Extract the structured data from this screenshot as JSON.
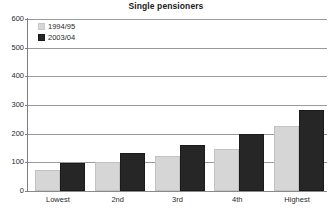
{
  "chart_data": {
    "type": "bar",
    "title": "Single pensioners",
    "xlabel": "",
    "ylabel": "",
    "ylim": [
      0,
      600
    ],
    "yticks": [
      0,
      100,
      200,
      300,
      400,
      500,
      600
    ],
    "grid": true,
    "legend_position": "top-left",
    "categories": [
      "Lowest",
      "2nd",
      "3rd",
      "4th",
      "Highest"
    ],
    "series": [
      {
        "name": "1994/95",
        "color": "#d6d6d6",
        "values": [
          75,
          102,
          123,
          148,
          226
        ]
      },
      {
        "name": "2003/04",
        "color": "#262626",
        "values": [
          98,
          131,
          161,
          198,
          283
        ]
      }
    ]
  },
  "legend": {
    "items": [
      {
        "label": "1994/95"
      },
      {
        "label": "2003/04"
      }
    ]
  },
  "axis": {
    "y_tick_labels": [
      "600",
      "500",
      "400",
      "300",
      "200",
      "100",
      "0"
    ],
    "x_tick_labels": [
      "Lowest",
      "2nd",
      "3rd",
      "4th",
      "Highest"
    ]
  }
}
